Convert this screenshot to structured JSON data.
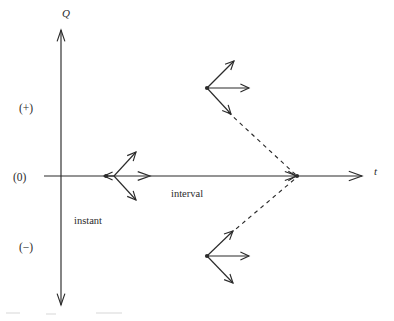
{
  "figure": {
    "stroke_color": "#2b2b2b",
    "background_color": "#ffffff",
    "dash_pattern": "4,4"
  },
  "axes": {
    "vertical": {
      "label": "Q",
      "label_x": 62,
      "label_y": 8,
      "x": 61,
      "y_top": 30,
      "y_bottom": 305,
      "arrow_top": true,
      "arrow_bottom": true
    },
    "horizontal": {
      "label": "t",
      "label_x": 374,
      "label_y": 166,
      "y": 176,
      "x_left": 44,
      "x_right": 362,
      "arrow_right": true
    }
  },
  "sign_labels": [
    {
      "text": "(+)",
      "x": 19,
      "y": 103,
      "name": "positive-region-label"
    },
    {
      "text": "(0)",
      "x": 13,
      "y": 172,
      "name": "zero-region-label"
    },
    {
      "text": "(−)",
      "x": 19,
      "y": 242,
      "name": "negative-region-label"
    }
  ],
  "annotations": [
    {
      "text": "instant",
      "x": 74,
      "y": 216,
      "name": "instant-label"
    },
    {
      "text": "interval",
      "x": 171,
      "y": 189,
      "name": "interval-label"
    }
  ],
  "nodes": [
    {
      "name": "instant-node",
      "dot": {
        "x": 106,
        "y": 176
      },
      "hub": {
        "x": 114,
        "y": 176
      },
      "arrows": [
        {
          "name": "instant-arrow-up-right",
          "x2": 136,
          "y2": 152
        },
        {
          "name": "instant-arrow-left",
          "x2": 104,
          "y2": 176
        },
        {
          "name": "instant-arrow-down-right",
          "x2": 136,
          "y2": 200
        }
      ],
      "axis_arrow": {
        "name": "instant-axis-arrow",
        "x": 150,
        "y": 176
      }
    },
    {
      "name": "upper-node",
      "dot": {
        "x": 207,
        "y": 88
      },
      "hub": {
        "x": 207,
        "y": 88
      },
      "arrows": [
        {
          "name": "upper-arrow-up-right",
          "x2": 234,
          "y2": 61
        },
        {
          "name": "upper-arrow-right",
          "x2": 249,
          "y2": 88
        },
        {
          "name": "upper-arrow-down-right",
          "x2": 231,
          "y2": 114
        }
      ]
    },
    {
      "name": "lower-node",
      "dot": {
        "x": 207,
        "y": 256
      },
      "hub": {
        "x": 207,
        "y": 256
      },
      "arrows": [
        {
          "name": "lower-arrow-up-right",
          "x2": 233,
          "y2": 231
        },
        {
          "name": "lower-arrow-right",
          "x2": 249,
          "y2": 256
        },
        {
          "name": "lower-arrow-down-right",
          "x2": 233,
          "y2": 283
        }
      ]
    }
  ],
  "vertex": {
    "name": "interval-vertex",
    "x": 297,
    "y": 176,
    "has_arrowhead": true
  },
  "dashed_connectors": [
    {
      "name": "upper-dashed-connector",
      "x1": 228,
      "y1": 112,
      "x2": 296,
      "y2": 175
    },
    {
      "name": "lower-dashed-connector",
      "x1": 230,
      "y1": 234,
      "x2": 296,
      "y2": 178
    }
  ]
}
